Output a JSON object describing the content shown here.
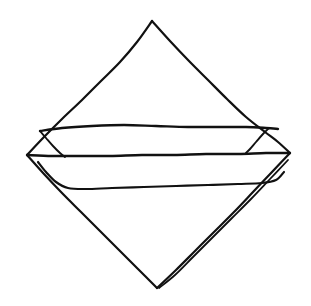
{
  "figure": {
    "title": "Folded Napkin Line Drawing",
    "style": "hand-drawn ink line sketch",
    "background_color": "#ffffff",
    "ink_color": "#111111",
    "canvas": {
      "width": 311,
      "height": 306
    }
  },
  "drawing_data": {
    "type": "line-drawing",
    "description": "A square cloth rotated 45 degrees into a diamond, with a horizontal folded band across the middle and a doubled hem line along the lower-right edge.",
    "vertices": {
      "top": [
        152,
        21
      ],
      "left": [
        27,
        155
      ],
      "right": [
        290,
        153
      ],
      "bottom": [
        157,
        288
      ]
    },
    "strokes": [
      {
        "name": "upper-left-edge",
        "semantic": "outer contour from left vertex to top vertex",
        "width": 2.2,
        "points": [
          [
            27,
            155
          ],
          [
            44,
            137
          ],
          [
            62,
            119
          ],
          [
            82,
            100
          ],
          [
            101,
            81
          ],
          [
            120,
            62
          ],
          [
            137,
            42
          ],
          [
            152,
            21
          ]
        ]
      },
      {
        "name": "upper-right-edge",
        "semantic": "outer contour from top vertex down to right vertex",
        "width": 2.2,
        "points": [
          [
            152,
            21
          ],
          [
            170,
            41
          ],
          [
            189,
            61
          ],
          [
            208,
            80
          ],
          [
            227,
            99
          ],
          [
            246,
            117
          ],
          [
            265,
            132
          ],
          [
            278,
            142
          ],
          [
            290,
            153
          ]
        ]
      },
      {
        "name": "lower-left-edge",
        "semantic": "outer contour from left vertex down to bottom vertex",
        "width": 2.2,
        "points": [
          [
            27,
            155
          ],
          [
            44,
            174
          ],
          [
            62,
            193
          ],
          [
            81,
            212
          ],
          [
            100,
            231
          ],
          [
            119,
            250
          ],
          [
            138,
            269
          ],
          [
            157,
            288
          ]
        ]
      },
      {
        "name": "lower-right-edge-outer",
        "semantic": "outer contour from right vertex down to bottom vertex",
        "width": 2.2,
        "points": [
          [
            290,
            153
          ],
          [
            272,
            172
          ],
          [
            253,
            192
          ],
          [
            234,
            212
          ],
          [
            214,
            232
          ],
          [
            195,
            251
          ],
          [
            176,
            270
          ],
          [
            157,
            288
          ]
        ]
      },
      {
        "name": "lower-right-edge-inner",
        "semantic": "parallel hem fold line inside the lower-right edge",
        "width": 1.8,
        "points": [
          [
            288,
            160
          ],
          [
            270,
            179
          ],
          [
            251,
            199
          ],
          [
            232,
            218
          ],
          [
            212,
            238
          ],
          [
            193,
            257
          ],
          [
            175,
            275
          ],
          [
            159,
            288
          ]
        ]
      },
      {
        "name": "band-top-line",
        "semantic": "upper horizontal fold of the napkin band",
        "width": 2.4,
        "points": [
          [
            40,
            131
          ],
          [
            62,
            128
          ],
          [
            92,
            126
          ],
          [
            124,
            125
          ],
          [
            156,
            126
          ],
          [
            188,
            127
          ],
          [
            218,
            127
          ],
          [
            246,
            127
          ],
          [
            266,
            128
          ],
          [
            278,
            129
          ]
        ]
      },
      {
        "name": "band-left-flap",
        "semantic": "short diagonal connecting band top-line to the left vertex region",
        "width": 1.9,
        "points": [
          [
            40,
            131
          ],
          [
            46,
            138
          ],
          [
            53,
            146
          ],
          [
            60,
            153
          ],
          [
            65,
            157
          ]
        ]
      },
      {
        "name": "band-right-flap",
        "semantic": "short diagonal connecting band top-line to the right vertex region",
        "width": 1.9,
        "points": [
          [
            269,
            128
          ],
          [
            263,
            134
          ],
          [
            256,
            142
          ],
          [
            250,
            149
          ],
          [
            246,
            153
          ]
        ]
      },
      {
        "name": "band-middle-line",
        "semantic": "central horizontal fold spanning the full width vertex to vertex",
        "width": 2.4,
        "points": [
          [
            27,
            155
          ],
          [
            52,
            156
          ],
          [
            80,
            156
          ],
          [
            110,
            156
          ],
          [
            142,
            155
          ],
          [
            174,
            155
          ],
          [
            206,
            154
          ],
          [
            238,
            154
          ],
          [
            266,
            153
          ],
          [
            290,
            153
          ]
        ]
      },
      {
        "name": "band-bottom-line",
        "semantic": "lower horizontal fold of the napkin band",
        "width": 2.2,
        "points": [
          [
            38,
            162
          ],
          [
            46,
            172
          ],
          [
            56,
            182
          ],
          [
            68,
            188
          ],
          [
            86,
            189
          ],
          [
            112,
            188
          ],
          [
            144,
            187
          ],
          [
            176,
            186
          ],
          [
            208,
            185
          ],
          [
            238,
            184
          ],
          [
            262,
            183
          ],
          [
            276,
            180
          ],
          [
            284,
            172
          ]
        ]
      }
    ]
  }
}
